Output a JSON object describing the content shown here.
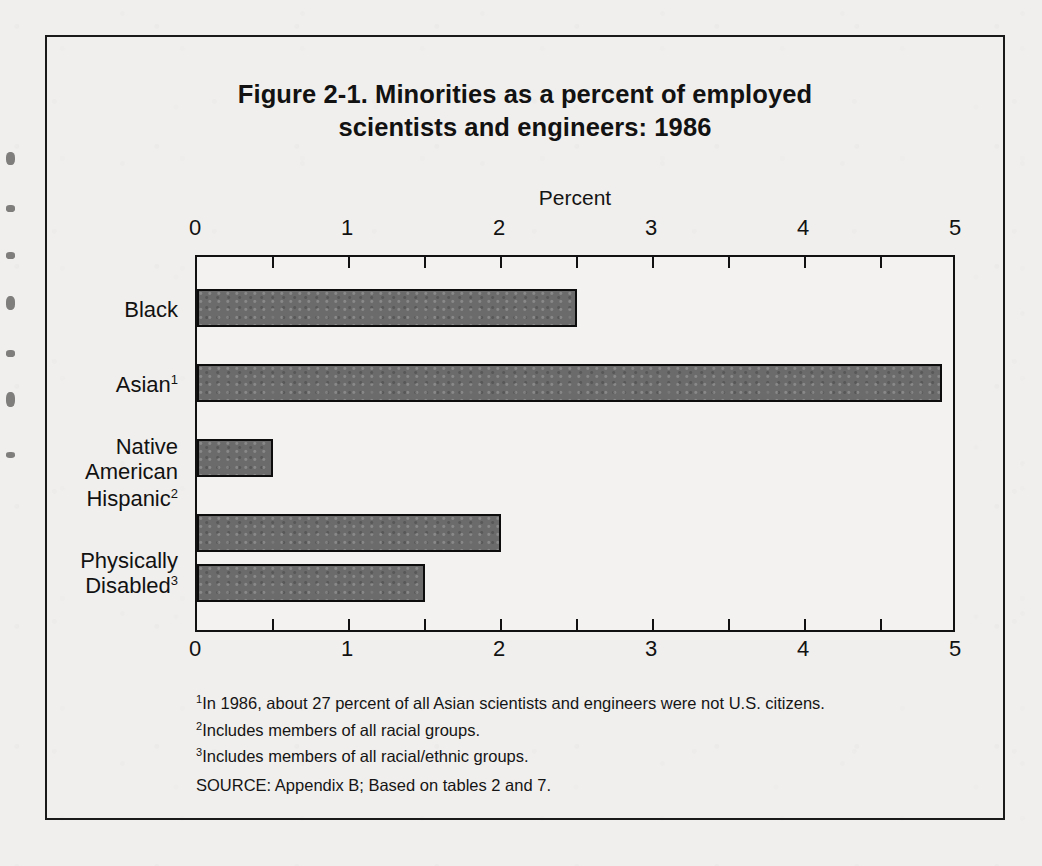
{
  "figure": {
    "title_line1": "Figure 2-1.  Minorities as a percent of employed",
    "title_line2": "scientists and engineers:  1986"
  },
  "chart_data": {
    "type": "bar",
    "orientation": "horizontal",
    "title": "Figure 2-1. Minorities as a percent of employed scientists and engineers: 1986",
    "xlabel": "Percent",
    "ylabel": "",
    "xlim": [
      0,
      5
    ],
    "xticks": [
      0,
      1,
      2,
      3,
      4,
      5
    ],
    "xtick_labels": [
      "0",
      "1",
      "2",
      "3",
      "4",
      "5"
    ],
    "minor_tick_interval": 0.5,
    "axis_title_position": "top",
    "tick_labels_both_axes": true,
    "grid": false,
    "legend": null,
    "bar_fill_color": "#6b6b6b",
    "bar_edge_color": "#0d0d0d",
    "categories": [
      "Black",
      "Asian",
      "Native American",
      "Hispanic",
      "Physically Disabled"
    ],
    "category_footnote_markers": [
      "",
      "1",
      "",
      "2",
      "3"
    ],
    "values": [
      2.5,
      4.9,
      0.5,
      2.0,
      1.5
    ]
  },
  "categories": [
    {
      "line1": "Black",
      "line2": "",
      "marker": "",
      "value": 2.5
    },
    {
      "line1": "Asian",
      "line2": "",
      "marker": "1",
      "value": 4.9
    },
    {
      "line1": "Native",
      "line2": "American",
      "marker": "",
      "value": 0.5
    },
    {
      "line1": "Hispanic",
      "line2": "",
      "marker": "2",
      "value": 2.0
    },
    {
      "line1": "Physically",
      "line2": "Disabled",
      "marker": "3",
      "value": 1.5
    }
  ],
  "axis": {
    "title": "Percent",
    "tick_labels": [
      "0",
      "1",
      "2",
      "3",
      "4",
      "5"
    ]
  },
  "notes": [
    {
      "marker": "1",
      "text": "In 1986, about 27 percent of all Asian scientists and engineers were not U.S. citizens."
    },
    {
      "marker": "2",
      "text": "Includes members of all racial groups."
    },
    {
      "marker": "3",
      "text": "Includes members of all racial/ethnic groups."
    }
  ],
  "source": "SOURCE:  Appendix B; Based on tables 2 and 7."
}
